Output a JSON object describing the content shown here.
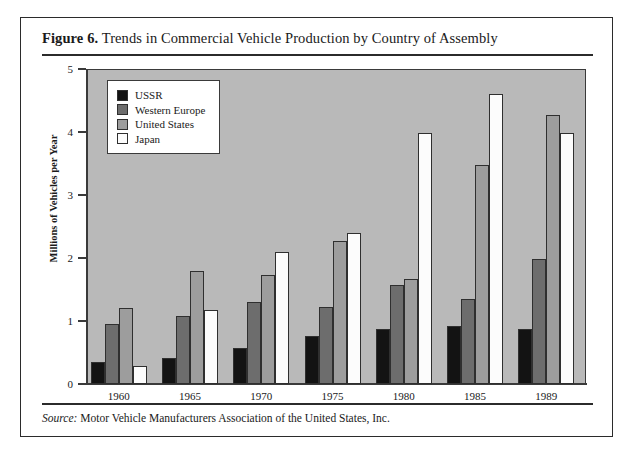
{
  "figure": {
    "label": "Figure 6.",
    "title": " Trends in Commercial Vehicle Production by Country of Assembly",
    "source_label": "Source:",
    "source_text": " Motor Vehicle Manufacturers Association of the United States, Inc."
  },
  "chart_data": {
    "type": "bar",
    "title": "Trends in Commercial Vehicle Production by Country of Assembly",
    "xlabel": "",
    "ylabel": "Millions of Vehicles per Year",
    "categories": [
      "1960",
      "1965",
      "1970",
      "1975",
      "1980",
      "1985",
      "1989"
    ],
    "ylim": [
      0,
      5
    ],
    "yticks": [
      "0",
      "1",
      "2",
      "3",
      "4",
      "5"
    ],
    "grid": false,
    "legend_position": "top-left inside plot",
    "series": [
      {
        "name": "USSR",
        "color": "#131313",
        "values": [
          0.35,
          0.42,
          0.57,
          0.77,
          0.87,
          0.92,
          0.88
        ]
      },
      {
        "name": "Western Europe",
        "color": "#6d6d6d",
        "values": [
          0.95,
          1.08,
          1.3,
          1.22,
          1.57,
          1.35,
          1.98
        ]
      },
      {
        "name": "United States",
        "color": "#9d9d9d",
        "values": [
          1.2,
          1.8,
          1.73,
          2.27,
          1.66,
          3.47,
          4.27
        ]
      },
      {
        "name": "Japan",
        "color": "#fcfcfc",
        "values": [
          0.28,
          1.17,
          2.1,
          2.4,
          3.99,
          4.6,
          3.98
        ]
      }
    ]
  }
}
